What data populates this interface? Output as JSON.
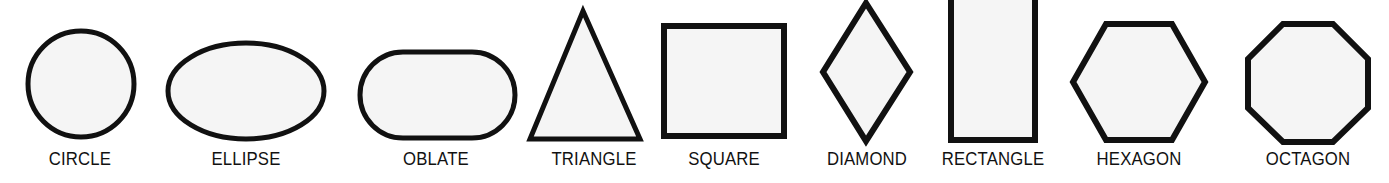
{
  "figure": {
    "background_color": "#ffffff",
    "shape_fill_color": "#f5f5f5",
    "shape_stroke_color": "#111111",
    "label_color": "#111111"
  },
  "shapes": [
    {
      "id": "circle",
      "label": "CIRCLE",
      "sides": 0,
      "kind": "circle"
    },
    {
      "id": "ellipse",
      "label": "ELLIPSE",
      "sides": 0,
      "kind": "ellipse"
    },
    {
      "id": "oblate",
      "label": "OBLATE",
      "sides": 0,
      "kind": "stadium"
    },
    {
      "id": "triangle",
      "label": "TRIANGLE",
      "sides": 3,
      "kind": "polygon"
    },
    {
      "id": "square",
      "label": "SQUARE",
      "sides": 4,
      "kind": "polygon"
    },
    {
      "id": "diamond",
      "label": "DIAMOND",
      "sides": 4,
      "kind": "polygon"
    },
    {
      "id": "rectangle",
      "label": "RECTANGLE",
      "sides": 4,
      "kind": "polygon"
    },
    {
      "id": "hexagon",
      "label": "HEXAGON",
      "sides": 6,
      "kind": "polygon"
    },
    {
      "id": "octagon",
      "label": "OCTAGON",
      "sides": 8,
      "kind": "polygon"
    }
  ]
}
